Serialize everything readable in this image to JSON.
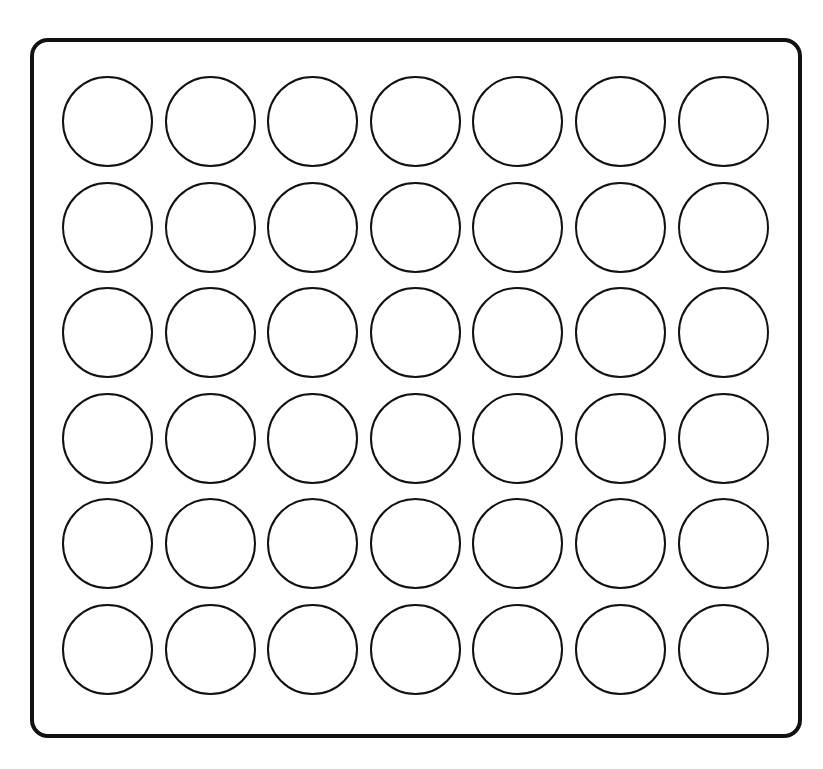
{
  "game": {
    "type": "connect-four-board",
    "rows": 6,
    "columns": 7,
    "colors": {
      "frame": "#111111",
      "background": "#ffffff",
      "slot_outline": "#111111"
    },
    "board": [
      [
        "empty",
        "empty",
        "empty",
        "empty",
        "empty",
        "empty",
        "empty"
      ],
      [
        "empty",
        "empty",
        "empty",
        "empty",
        "empty",
        "empty",
        "empty"
      ],
      [
        "empty",
        "empty",
        "empty",
        "empty",
        "empty",
        "empty",
        "empty"
      ],
      [
        "empty",
        "empty",
        "empty",
        "empty",
        "empty",
        "empty",
        "empty"
      ],
      [
        "empty",
        "empty",
        "empty",
        "empty",
        "empty",
        "empty",
        "empty"
      ],
      [
        "empty",
        "empty",
        "empty",
        "empty",
        "empty",
        "empty",
        "empty"
      ]
    ]
  }
}
